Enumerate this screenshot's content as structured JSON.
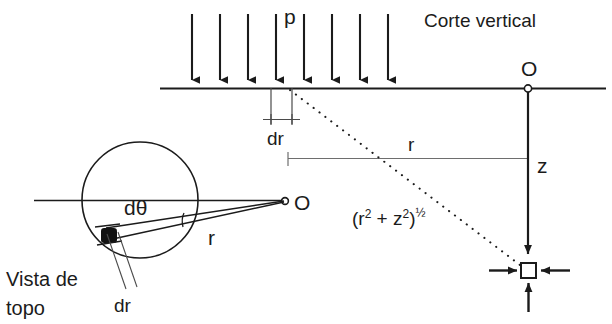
{
  "figure": {
    "title_vertical_section": "Corte vertical",
    "caption_top_view_line1": "Vista de",
    "caption_top_view_line2": "topo",
    "load_label": "p",
    "origin_label_vertical": "O",
    "origin_label_topview": "O",
    "radial_increment_label_vertical": "dr",
    "radial_increment_label_topview": "dr",
    "radius_label_vertical": "r",
    "radius_label_topview": "r",
    "depth_label": "z",
    "angle_label": "dθ",
    "distance_formula_open": "(r",
    "distance_formula_sup1": "2",
    "distance_formula_plus": " + z",
    "distance_formula_sup2": "2",
    "distance_formula_close": ")",
    "distance_formula_exponent": "½",
    "colors": {
      "ink": "#1b1b1b",
      "thin_ink": "#4a4a4a",
      "dimension_gray": "#6e6e6e",
      "background": "#ffffff"
    },
    "counts": {
      "load_arrows": 8
    },
    "geometry_notes": {
      "ground_line_y": 88,
      "origin_x": 528,
      "depth_point_y": 270,
      "top_view_circle_center_x": 140,
      "top_view_circle_center_y": 200,
      "top_view_circle_radius": 58
    }
  }
}
